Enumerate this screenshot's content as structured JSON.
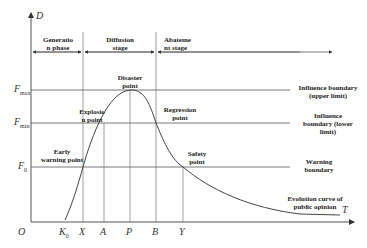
{
  "diagram": {
    "axes": {
      "y_label": "D",
      "x_label": "T",
      "origin_label": "O",
      "x_ticks": [
        {
          "label": "K",
          "sub": "0"
        },
        {
          "label": "X"
        },
        {
          "label": "A"
        },
        {
          "label": "P"
        },
        {
          "label": "B"
        },
        {
          "label": "Y"
        }
      ],
      "y_levels": [
        {
          "label": "F",
          "sub": "max"
        },
        {
          "label": "F",
          "sub": "min"
        },
        {
          "label": "F",
          "sub": "0"
        }
      ]
    },
    "stages": [
      {
        "label": "Generation phase",
        "line1": "Generatio",
        "line2": "n phase"
      },
      {
        "label": "Diffusion stage",
        "line1": "Diffusion",
        "line2": "stage"
      },
      {
        "label": "Abatement stage",
        "line1": "Abateme",
        "line2": "nt stage"
      }
    ],
    "points": {
      "early_warning": {
        "line1": "Early",
        "line2": "warning point"
      },
      "explosion": {
        "line1": "Explosio",
        "line2": "n point"
      },
      "disaster": {
        "line1": "Disaster",
        "line2": "point"
      },
      "regression": {
        "line1": "Regression",
        "line2": "point"
      },
      "safety": {
        "line1": "Safety",
        "line2": "point"
      }
    },
    "boundaries": {
      "upper": {
        "line1": "Influence boundary",
        "line2": "(upper limit)"
      },
      "lower": {
        "line1": "Influence",
        "line2": "boundary (lower",
        "line3": "limit)"
      },
      "warning": {
        "line1": "Warning",
        "line2": "boundary"
      }
    },
    "curve_label": {
      "line1": "Evolution curve of",
      "line2": "public opinion"
    }
  }
}
